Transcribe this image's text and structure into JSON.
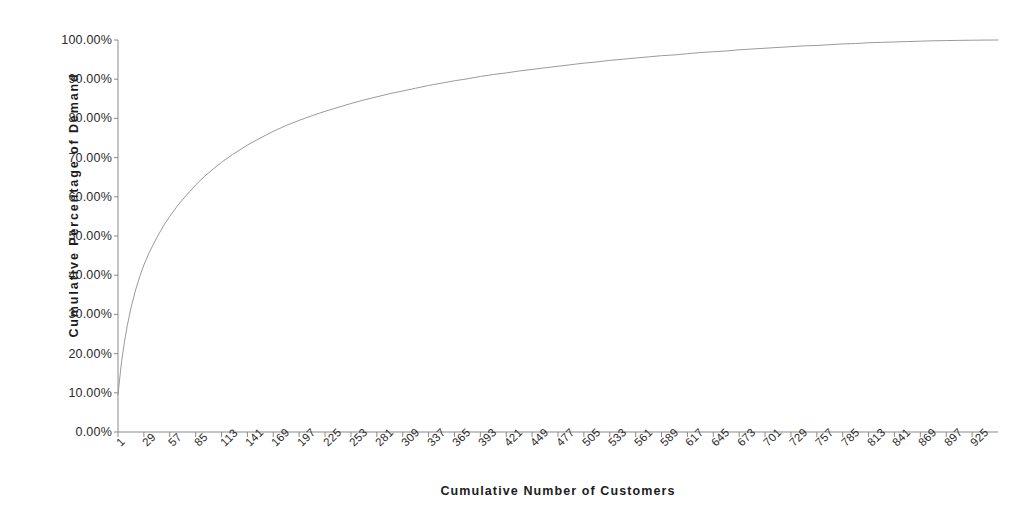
{
  "chart_data": {
    "type": "line",
    "title": "",
    "xlabel": "Cumulative Number of Customers",
    "ylabel": "Cumulative Percentage of Demand",
    "xlim": [
      1,
      953
    ],
    "ylim": [
      0,
      100
    ],
    "grid": false,
    "legend": null,
    "y_tick_labels": [
      "100.00%",
      "90.00%",
      "80.00%",
      "70.00%",
      "60.00%",
      "50.00%",
      "40.00%",
      "30.00%",
      "20.00%",
      "10.00%",
      "0.00%"
    ],
    "y_ticks": [
      100,
      90,
      80,
      70,
      60,
      50,
      40,
      30,
      20,
      10,
      0
    ],
    "x_tick_labels": [
      "1",
      "29",
      "57",
      "85",
      "113",
      "141",
      "169",
      "197",
      "225",
      "253",
      "281",
      "309",
      "337",
      "365",
      "393",
      "421",
      "449",
      "477",
      "505",
      "533",
      "561",
      "589",
      "617",
      "645",
      "673",
      "701",
      "729",
      "757",
      "785",
      "813",
      "841",
      "869",
      "897",
      "925"
    ],
    "x_ticks": [
      1,
      29,
      57,
      85,
      113,
      141,
      169,
      197,
      225,
      253,
      281,
      309,
      337,
      365,
      393,
      421,
      449,
      477,
      505,
      533,
      561,
      589,
      617,
      645,
      673,
      701,
      729,
      757,
      785,
      813,
      841,
      869,
      897,
      925
    ],
    "line_color": "#9a9a9a",
    "line_width": 1,
    "axis_color": "#8a8a8a",
    "series": [
      {
        "name": "Cumulative Percentage of Demand",
        "x": [
          1,
          3,
          5,
          8,
          11,
          15,
          20,
          25,
          29,
          35,
          43,
          50,
          57,
          66,
          75,
          85,
          95,
          105,
          113,
          125,
          141,
          155,
          169,
          183,
          197,
          211,
          225,
          239,
          253,
          267,
          281,
          295,
          309,
          323,
          337,
          351,
          365,
          379,
          393,
          407,
          421,
          435,
          449,
          463,
          477,
          491,
          505,
          519,
          533,
          547,
          561,
          575,
          589,
          603,
          617,
          631,
          645,
          659,
          673,
          687,
          701,
          715,
          729,
          743,
          757,
          771,
          785,
          799,
          813,
          827,
          841,
          855,
          869,
          883,
          897,
          911,
          925,
          939,
          953
        ],
        "y": [
          9.5,
          14.0,
          18.2,
          23.0,
          27.1,
          31.6,
          36.2,
          40.0,
          42.6,
          45.9,
          49.6,
          52.5,
          55.0,
          57.9,
          60.4,
          63.0,
          65.3,
          67.3,
          68.8,
          70.8,
          73.2,
          75.0,
          76.7,
          78.2,
          79.5,
          80.7,
          81.8,
          82.8,
          83.8,
          84.7,
          85.5,
          86.3,
          87.0,
          87.7,
          88.4,
          89.0,
          89.6,
          90.1,
          90.7,
          91.2,
          91.6,
          92.1,
          92.5,
          92.9,
          93.3,
          93.7,
          94.1,
          94.4,
          94.8,
          95.1,
          95.4,
          95.7,
          96.0,
          96.2,
          96.5,
          96.8,
          97.0,
          97.2,
          97.5,
          97.7,
          97.9,
          98.1,
          98.3,
          98.5,
          98.6,
          98.8,
          99.0,
          99.1,
          99.3,
          99.4,
          99.5,
          99.6,
          99.7,
          99.8,
          99.85,
          99.9,
          99.95,
          99.98,
          100.0
        ]
      }
    ]
  }
}
